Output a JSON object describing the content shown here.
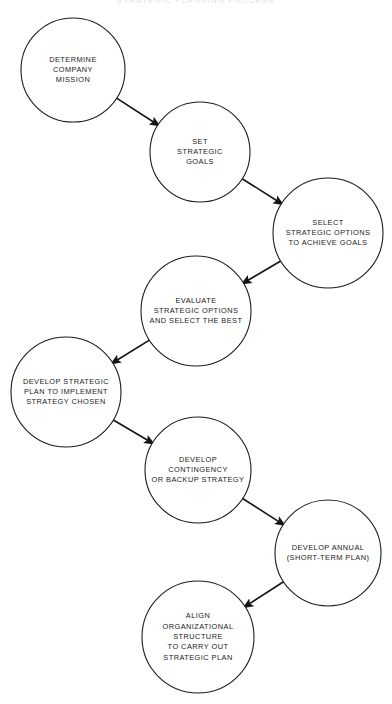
{
  "title": {
    "text": "STRATEGIC PLANNING PROCESS",
    "note": "cropped at top edge, nearly illegible"
  },
  "colors": {
    "background": "#ffffff",
    "circle_stroke": "#1d1d1d",
    "arrow": "#151515",
    "text": "#1a1a1a",
    "title_faint": "#c9cad1"
  },
  "chart_data": {
    "type": "diagram",
    "title": "STRATEGIC PLANNING PROCESS",
    "layout": "zigzag cascading circles, top to bottom",
    "nodes": [
      {
        "id": "determine-company-mission",
        "order": 1,
        "cx": 73,
        "cy": 70,
        "r": 52,
        "lines": [
          "DETERMINE",
          "COMPANY",
          "MISSION"
        ]
      },
      {
        "id": "set-strategic-goals",
        "order": 2,
        "cx": 200,
        "cy": 152,
        "r": 50,
        "lines": [
          "SET",
          "STRATEGIC",
          "GOALS"
        ]
      },
      {
        "id": "select-strategic-options",
        "order": 3,
        "cx": 328,
        "cy": 233,
        "r": 55,
        "lines": [
          "SELECT",
          "STRATEGIC OPTIONS",
          "TO ACHIEVE GOALS"
        ]
      },
      {
        "id": "evaluate-strategic-options",
        "order": 4,
        "cx": 196,
        "cy": 311,
        "r": 55,
        "lines": [
          "EVALUATE",
          "STRATEGIC OPTIONS",
          "AND SELECT THE BEST"
        ]
      },
      {
        "id": "develop-strategic-plan",
        "order": 5,
        "cx": 66,
        "cy": 392,
        "r": 55,
        "lines": [
          "DEVELOP STRATEGIC",
          "PLAN TO IMPLEMENT",
          "STRATEGY CHOSEN"
        ]
      },
      {
        "id": "develop-contingency-strategy",
        "order": 6,
        "cx": 198,
        "cy": 470,
        "r": 53,
        "lines": [
          "DEVELOP",
          "CONTINGENCY",
          "OR BACKUP STRATEGY"
        ]
      },
      {
        "id": "develop-annual-plan",
        "order": 7,
        "cx": 328,
        "cy": 553,
        "r": 53,
        "lines": [
          "DEVELOP ANNUAL",
          "(SHORT-TERM PLAN)"
        ]
      },
      {
        "id": "align-organizational-structure",
        "order": 8,
        "cx": 198,
        "cy": 637,
        "r": 56,
        "lines": [
          "ALIGN",
          "ORGANIZATIONAL",
          "STRUCTURE",
          "TO CARRY OUT",
          "STRATEGIC PLAN"
        ]
      }
    ],
    "edges": [
      {
        "from": "determine-company-mission",
        "to": "set-strategic-goals",
        "direction": "down-right"
      },
      {
        "from": "set-strategic-goals",
        "to": "select-strategic-options",
        "direction": "down-right"
      },
      {
        "from": "select-strategic-options",
        "to": "evaluate-strategic-options",
        "direction": "down-left"
      },
      {
        "from": "evaluate-strategic-options",
        "to": "develop-strategic-plan",
        "direction": "down-left"
      },
      {
        "from": "develop-strategic-plan",
        "to": "develop-contingency-strategy",
        "direction": "down-right"
      },
      {
        "from": "develop-contingency-strategy",
        "to": "develop-annual-plan",
        "direction": "down-right"
      },
      {
        "from": "develop-annual-plan",
        "to": "align-organizational-structure",
        "direction": "down-left"
      }
    ]
  }
}
